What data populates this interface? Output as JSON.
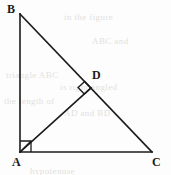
{
  "figure": {
    "background_color": "#fdfdfd",
    "stroke_color": "#1b1b1b",
    "stroke_width": 1.6,
    "canvas": {
      "width": 171,
      "height": 175
    }
  },
  "points": {
    "A": {
      "label": "A",
      "x": 20,
      "y": 152,
      "label_x": 12,
      "label_y": 156
    },
    "B": {
      "label": "B",
      "x": 20,
      "y": 14,
      "label_x": 7,
      "label_y": 3
    },
    "C": {
      "label": "C",
      "x": 152,
      "y": 152,
      "label_x": 152,
      "label_y": 156
    },
    "D": {
      "label": "D",
      "x": 91,
      "y": 88,
      "label_x": 92,
      "label_y": 69
    }
  },
  "segments": [
    {
      "name": "AB",
      "from": "A",
      "to": "B"
    },
    {
      "name": "BC",
      "from": "B",
      "to": "C"
    },
    {
      "name": "AC",
      "from": "A",
      "to": "C"
    },
    {
      "name": "AD",
      "from": "A",
      "to": "D"
    }
  ],
  "right_angle_markers": [
    {
      "name": "right-angle-at-A",
      "at": "A",
      "size": 11,
      "has_diagonal": true
    },
    {
      "name": "right-angle-at-D",
      "at": "D",
      "size": 9,
      "rotation_deg": 45,
      "has_diagonal": false
    }
  ],
  "ghost_text": {
    "description": "faint show-through text from reverse side of printed page",
    "color": "#dedcd9",
    "lines": [
      {
        "text": "in the figure",
        "x": 64,
        "y": 12
      },
      {
        "text": "ABC and",
        "x": 92,
        "y": 36
      },
      {
        "text": "triangle ABC",
        "x": 6,
        "y": 70
      },
      {
        "text": "is right angled",
        "x": 60,
        "y": 82
      },
      {
        "text": "the length of",
        "x": 4,
        "y": 96
      },
      {
        "text": "AD and BD",
        "x": 64,
        "y": 108
      },
      {
        "text": "hypotenuse",
        "x": 30,
        "y": 166
      }
    ]
  }
}
